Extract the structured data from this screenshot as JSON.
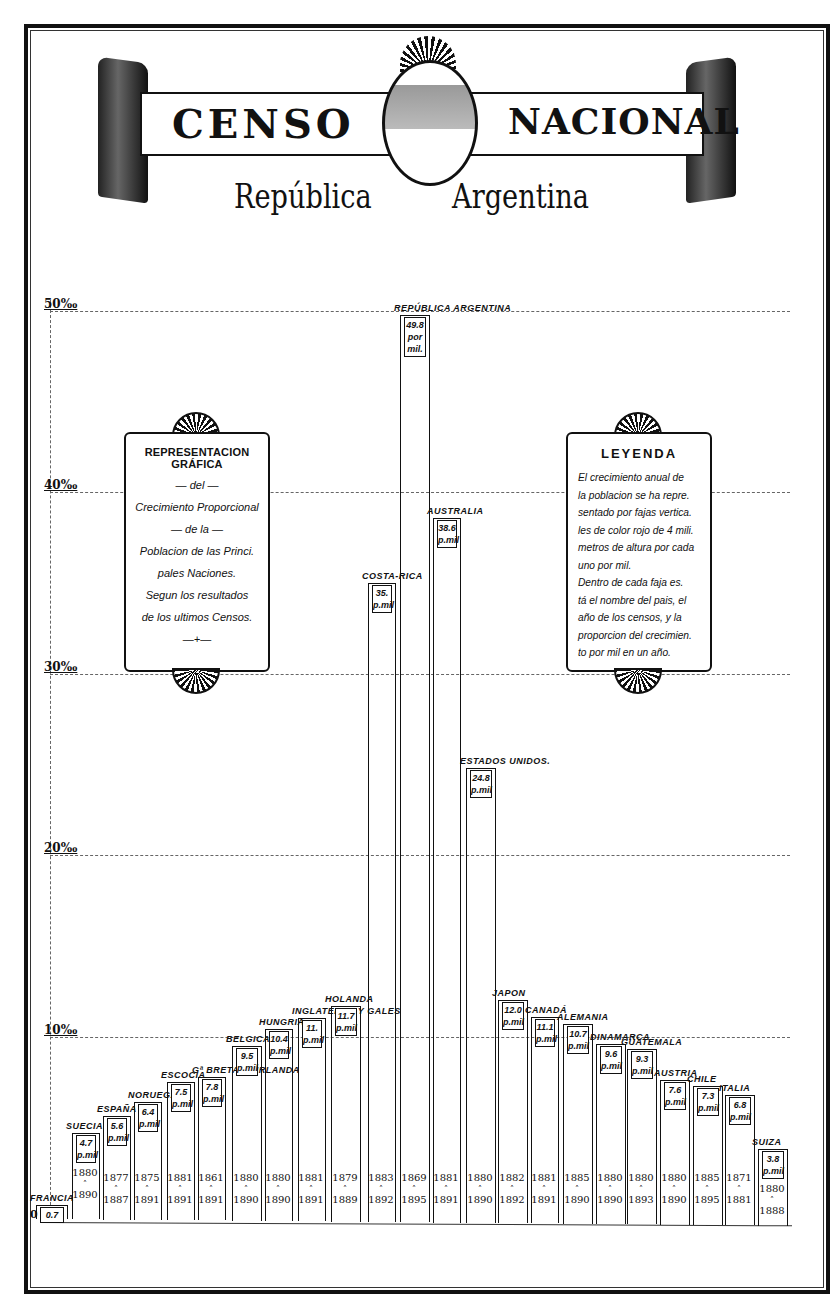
{
  "header": {
    "title_left": "CENSO",
    "title_right": "NACIONAL",
    "subtitle_left": "República",
    "subtitle_right": "Argentina",
    "emblem": "argentine-coat-of-arms"
  },
  "left_cartouche": {
    "title": "REPRESENTACION GRÁFICA",
    "lines": [
      "— del —",
      "Crecimiento Proporcional",
      "— de la —",
      "Poblacion de las Princi.",
      "pales Naciones.",
      "Segun los resultados",
      "de los ultimos Censos.",
      "—+—"
    ]
  },
  "legend_cartouche": {
    "title": "LEYENDA",
    "lines": [
      "El crecimiento anual de",
      "la poblacion se ha repre.",
      "sentado por fajas vertica.",
      "les de color rojo de 4 mili.",
      "metros de altura por cada",
      "uno por mil.",
      "  Dentro de cada faja es.",
      "tá el nombre del pais, el",
      "año de los censos, y la",
      "proporcion del crecimien.",
      "to por mil en un año."
    ]
  },
  "axis": {
    "ticks": [
      {
        "label": "50‰",
        "value": 50
      },
      {
        "label": "40‰",
        "value": 40
      },
      {
        "label": "30‰",
        "value": 30
      },
      {
        "label": "20‰",
        "value": 20
      },
      {
        "label": "10‰",
        "value": 10
      }
    ],
    "zero_label": "0"
  },
  "caption": "Population Growth in Argentina and Other Nations (partially visible)",
  "chart_data": {
    "type": "bar",
    "xlabel": "",
    "ylabel": "Crecimiento anual (por mil)",
    "ylim": [
      0,
      50
    ],
    "grid": true,
    "legend_position": "right (LEYENDA cartouche)",
    "categories": [
      "Francia",
      "Suecia",
      "España",
      "Noruega",
      "Escocia",
      "Gr. Bretaña Irlanda",
      "Bélgica",
      "Hungría",
      "Inglaterra y Gales",
      "Holanda",
      "Costa-Rica",
      "República Argentina",
      "Australia",
      "Estados Unidos",
      "Japón",
      "Canadá",
      "Alemania",
      "Dinamarca",
      "Guatemala",
      "Austria",
      "Chile",
      "Italia",
      "Suiza"
    ],
    "values": [
      0.7,
      4.7,
      5.6,
      6.4,
      7.5,
      7.8,
      9.5,
      10.4,
      11.0,
      11.7,
      35.0,
      49.8,
      38.6,
      24.8,
      12.0,
      11.1,
      10.7,
      9.6,
      9.3,
      7.6,
      7.3,
      6.8,
      3.8
    ],
    "value_labels": [
      "0.7",
      "4.7 p.mil",
      "5.6 p.mil",
      "6.4 p.mil",
      "7.5 p.mil",
      "7.8 p.mil",
      "9.5 p.mil",
      "10.4 p.mil",
      "11. p.mil",
      "11.7 p.mil",
      "35. p.mil",
      "49.8 por mil.",
      "38.6 p.mil",
      "24.8 p.mil",
      "12.0 p.mil",
      "11.1 p.mil",
      "10.7 p.mil",
      "9.6 p.mil",
      "9.3 p.mil",
      "7.6 p.mil",
      "7.3 p.mil",
      "6.8 p.mil",
      "3.8 p.mil"
    ],
    "census_years": [
      "",
      "1880 a 1890",
      "1877 a 1887",
      "1875 a 1891",
      "1881 a 1891",
      "1861 a 1891",
      "1880 a 1890",
      "1880 a 1890",
      "1881 a 1891",
      "1879 a 1889",
      "1883 a 1892",
      "1869 a 1895",
      "1881 a 1891",
      "1880 a 1890",
      "1882 a 1892",
      "1881 a 1891",
      "1885 a 1890",
      "1880 a 1890",
      "1880 a 1893",
      "1880 a 1890",
      "1885 a 1895",
      "1871 a 1881",
      "1880 a 1888"
    ],
    "tick_labels": [
      "0",
      "10‰",
      "20‰",
      "30‰",
      "40‰",
      "50‰"
    ]
  },
  "bars": [
    {
      "name": "FRANCIA",
      "value": "0.7",
      "unit": "",
      "y1": "",
      "y2": "",
      "x": 36,
      "w": 30,
      "h": 0.7
    },
    {
      "name": "SUECIA",
      "value": "4.7",
      "unit": "p.mil",
      "y1": "1880",
      "y2": "1890",
      "x": 72,
      "w": 26,
      "h": 4.7
    },
    {
      "name": "ESPAÑA",
      "value": "5.6",
      "unit": "p.mil",
      "y1": "1877",
      "y2": "1887",
      "x": 103,
      "w": 26,
      "h": 5.6
    },
    {
      "name": "NORUEGA",
      "value": "6.4",
      "unit": "p.mil",
      "y1": "1875",
      "y2": "1891",
      "x": 134,
      "w": 26,
      "h": 6.4
    },
    {
      "name": "ESCOCIA",
      "value": "7.5",
      "unit": "p.mil",
      "y1": "1881",
      "y2": "1891",
      "x": 167,
      "w": 26,
      "h": 7.5
    },
    {
      "name": "Gª BRETAÑA IRLANDA",
      "value": "7.8",
      "unit": "p.mil",
      "y1": "1861",
      "y2": "1891",
      "x": 198,
      "w": 26,
      "h": 7.8
    },
    {
      "name": "BELGICA",
      "value": "9.5",
      "unit": "p.mil",
      "y1": "1880",
      "y2": "1890",
      "x": 232,
      "w": 28,
      "h": 9.5
    },
    {
      "name": "HUNGRIA",
      "value": "10.4",
      "unit": "p.mil",
      "y1": "1880",
      "y2": "1890",
      "x": 265,
      "w": 26,
      "h": 10.4
    },
    {
      "name": "INGLATERRA Y GALES",
      "value": "11.",
      "unit": "p.mil",
      "y1": "1881",
      "y2": "1891",
      "x": 298,
      "w": 26,
      "h": 11.0
    },
    {
      "name": "HOLANDA",
      "value": "11.7",
      "unit": "p.mil",
      "y1": "1879",
      "y2": "1889",
      "x": 331,
      "w": 28,
      "h": 11.7
    },
    {
      "name": "COSTA-RICA",
      "value": "35.",
      "unit": "p.mil",
      "y1": "1883",
      "y2": "1892",
      "x": 368,
      "w": 26,
      "h": 35.0
    },
    {
      "name": "REPÚBLICA ARGENTINA",
      "value": "49.8",
      "unit": "por mil.",
      "y1": "1869",
      "y2": "1895",
      "x": 400,
      "w": 28,
      "h": 49.8
    },
    {
      "name": "AUSTRALIA",
      "value": "38.6",
      "unit": "p.mil",
      "y1": "1881",
      "y2": "1891",
      "x": 433,
      "w": 26,
      "h": 38.6
    },
    {
      "name": "ESTADOS UNIDOS.",
      "value": "24.8",
      "unit": "p.mil",
      "y1": "1880",
      "y2": "1890",
      "x": 466,
      "w": 28,
      "h": 24.8
    },
    {
      "name": "JAPON",
      "value": "12.0",
      "unit": "p.mil",
      "y1": "1882",
      "y2": "1892",
      "x": 498,
      "w": 28,
      "h": 12.0
    },
    {
      "name": "CANADÁ",
      "value": "11.1",
      "unit": "p.mil",
      "y1": "1881",
      "y2": "1891",
      "x": 531,
      "w": 26,
      "h": 11.1
    },
    {
      "name": "ALEMANIA",
      "value": "10.7",
      "unit": "p.mil",
      "y1": "1885",
      "y2": "1890",
      "x": 563,
      "w": 28,
      "h": 10.7
    },
    {
      "name": "DINAMARCA",
      "value": "9.6",
      "unit": "p.mil",
      "y1": "1880",
      "y2": "1890",
      "x": 596,
      "w": 28,
      "h": 9.6
    },
    {
      "name": "GUATEMALA",
      "value": "9.3",
      "unit": "p.mil",
      "y1": "1880",
      "y2": "1893",
      "x": 627,
      "w": 28,
      "h": 9.3
    },
    {
      "name": "AUSTRIA",
      "value": "7.6",
      "unit": "p.mil",
      "y1": "1880",
      "y2": "1890",
      "x": 660,
      "w": 28,
      "h": 7.6
    },
    {
      "name": "CHILE",
      "value": "7.3",
      "unit": "p.mil",
      "y1": "1885",
      "y2": "1895",
      "x": 693,
      "w": 28,
      "h": 7.3
    },
    {
      "name": "ITALIA",
      "value": "6.8",
      "unit": "p.mil",
      "y1": "1871",
      "y2": "1881",
      "x": 725,
      "w": 28,
      "h": 6.8
    },
    {
      "name": "SUIZA",
      "value": "3.8",
      "unit": "p.mil",
      "y1": "1880",
      "y2": "1888",
      "x": 758,
      "w": 28,
      "h": 3.8
    }
  ]
}
